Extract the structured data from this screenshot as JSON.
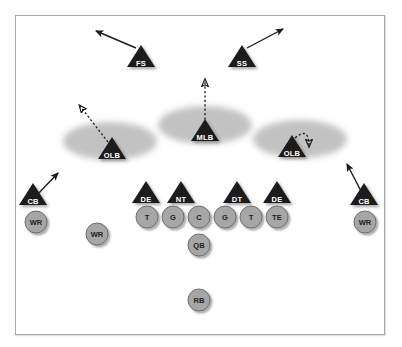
{
  "diagram": {
    "background_color": "#ffffff",
    "border_color": "#a9a9a9",
    "zone_color": "#bfbfbf",
    "defense_marker_color": "#1c1c1c",
    "offense_marker_color": "#a6a6a6",
    "arrow_color": "#1c1c1c"
  },
  "defense": {
    "secondary": [
      {
        "label": "FS",
        "x": 141,
        "y": 56,
        "arrow": "solid",
        "arrow_dir": "up-left"
      },
      {
        "label": "SS",
        "x": 242,
        "y": 56,
        "arrow": "solid",
        "arrow_dir": "up-right"
      },
      {
        "label": "CB",
        "x": 33,
        "y": 194,
        "arrow": "solid",
        "arrow_dir": "up-right"
      },
      {
        "label": "CB",
        "x": 364,
        "y": 194,
        "arrow": "solid",
        "arrow_dir": "up-left"
      }
    ],
    "linebackers": [
      {
        "label": "OLB",
        "x": 112,
        "y": 148,
        "arrow": "dashed",
        "arrow_dir": "up-left"
      },
      {
        "label": "MLB",
        "x": 205,
        "y": 130,
        "arrow": "dashed",
        "arrow_dir": "up"
      },
      {
        "label": "OLB",
        "x": 292,
        "y": 146,
        "arrow": "dashed-curve",
        "arrow_dir": "down-right"
      }
    ],
    "line": [
      {
        "label": "DE",
        "x": 146,
        "y": 192
      },
      {
        "label": "NT",
        "x": 181,
        "y": 192
      },
      {
        "label": "DT",
        "x": 237,
        "y": 192
      },
      {
        "label": "DE",
        "x": 277,
        "y": 192
      }
    ],
    "zones": [
      {
        "name": "left-flat-zone",
        "cx": 110,
        "cy": 141,
        "rx": 47,
        "ry": 19
      },
      {
        "name": "middle-hook-zone",
        "cx": 205,
        "cy": 125,
        "rx": 47,
        "ry": 19
      },
      {
        "name": "right-flat-zone",
        "cx": 300,
        "cy": 139,
        "rx": 47,
        "ry": 19
      }
    ]
  },
  "offense": {
    "line": [
      {
        "label": "T",
        "x": 147,
        "y": 217
      },
      {
        "label": "G",
        "x": 173,
        "y": 217
      },
      {
        "label": "C",
        "x": 199,
        "y": 217
      },
      {
        "label": "G",
        "x": 225,
        "y": 217
      },
      {
        "label": "T",
        "x": 251,
        "y": 217
      },
      {
        "label": "TE",
        "x": 277,
        "y": 217
      }
    ],
    "backs": [
      {
        "label": "QB",
        "x": 199,
        "y": 245
      },
      {
        "label": "RB",
        "x": 199,
        "y": 300
      }
    ],
    "receivers": [
      {
        "label": "WR",
        "x": 36,
        "y": 222
      },
      {
        "label": "WR",
        "x": 97,
        "y": 234
      },
      {
        "label": "WR",
        "x": 365,
        "y": 222
      }
    ]
  }
}
